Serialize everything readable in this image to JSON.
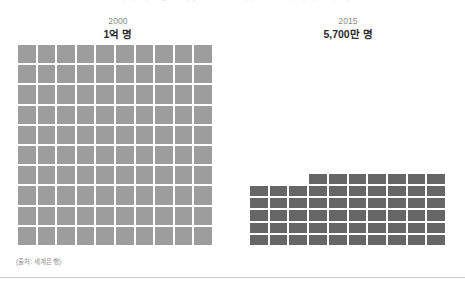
{
  "headline": {
    "text": "세계 극빈층 인구, 2000년 이후 절반 가까이 줄었다"
  },
  "panels": [
    {
      "name": "left",
      "year": "2000",
      "value": "1억 명",
      "filled": 100,
      "total": 100,
      "color": "#9d9d9d"
    },
    {
      "name": "right",
      "year": "2015",
      "value": "5,700만 명",
      "filled": 57,
      "total": 100,
      "color": "#666666"
    }
  ],
  "source": {
    "credit": "(출처: 세계은행)"
  },
  "colors": {
    "background": "#ffffff",
    "left_square": "#9d9d9d",
    "right_square": "#666666",
    "rule": "#c9c9c9",
    "year_text": "#8a8a8a",
    "value_text": "#2b2b2b",
    "credit_text": "#8d8d8d"
  },
  "chart_data": {
    "type": "waffle",
    "title": "세계 극빈층 인구, 2000년 이후 절반 가까이 줄었다",
    "unit_note": "1 square = 1% of 100 million",
    "categories": [
      "2000",
      "2015"
    ],
    "values": [
      100,
      57
    ],
    "value_labels": [
      "1억 명",
      "5,700만 명"
    ],
    "grid_columns": 10,
    "grid_rows": 10,
    "series": [
      {
        "name": "2000",
        "filled_squares": 100,
        "total_squares": 100,
        "color": "#9d9d9d"
      },
      {
        "name": "2015",
        "filled_squares": 57,
        "total_squares": 100,
        "color": "#666666"
      }
    ],
    "legend": "none",
    "grid": false,
    "source": "(출처: 세계은행)"
  }
}
